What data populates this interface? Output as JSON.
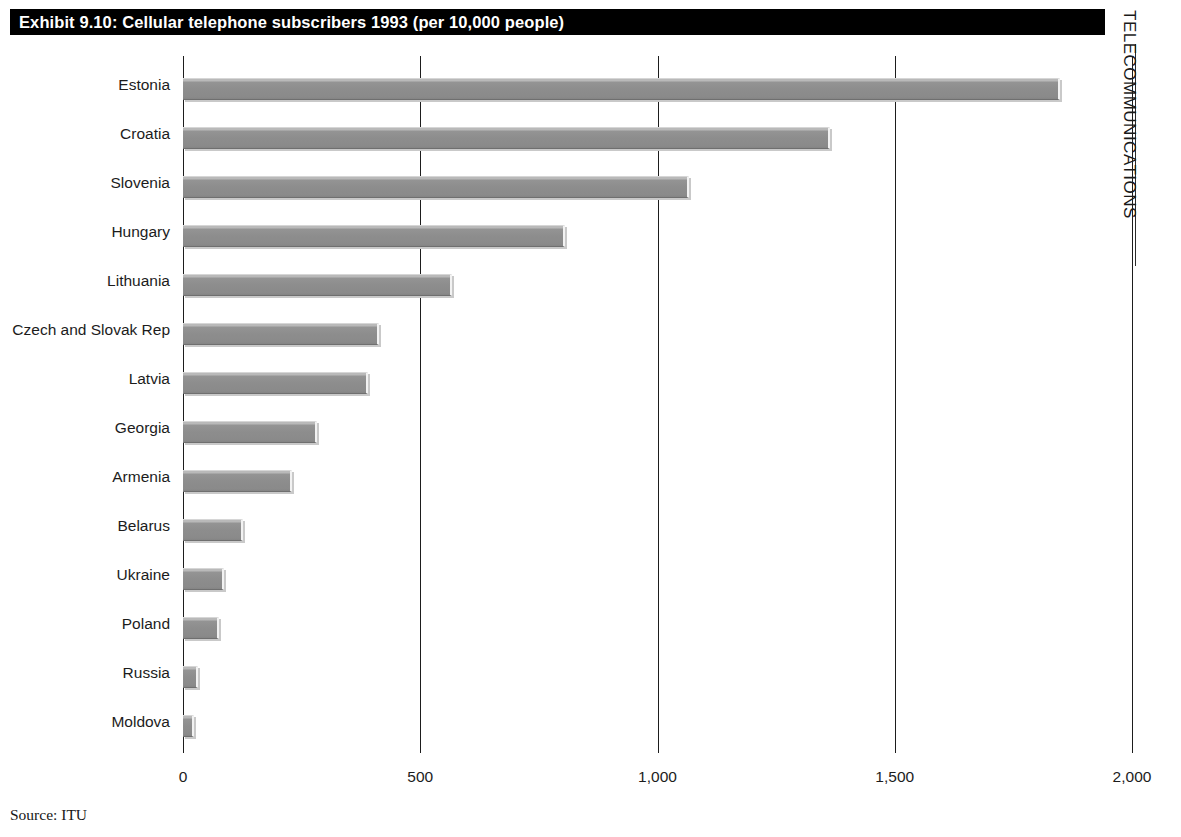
{
  "title": "Exhibit 9.10: Cellular telephone subscribers 1993 (per 10,000 people)",
  "side_caption": "TELECOMMUNICATIONS",
  "source_note": "Source: ITU",
  "colors": {
    "banner_background": "#000000",
    "banner_text": "#ffffff",
    "bar_fill": "#8a8a8a",
    "bar_highlight": "#b9b9b9",
    "bar_shadow": "#c9c9c9",
    "axis": "#1d1d1d",
    "text": "#1c1c1c"
  },
  "chart_data": {
    "type": "bar",
    "orientation": "horizontal",
    "title": "Exhibit 9.10: Cellular telephone subscribers 1993 (per 10,000 people)",
    "xlabel": "",
    "ylabel": "",
    "xlim": [
      0,
      2000
    ],
    "grid": true,
    "legend": "none",
    "xticks": [
      0,
      500,
      1000,
      1500,
      2000
    ],
    "xticklabels": [
      "0",
      "500",
      "1,000",
      "1,500",
      "2,000"
    ],
    "categories": [
      "Estonia",
      "Croatia",
      "Slovenia",
      "Hungary",
      "Lithuania",
      "Czech and Slovak Rep",
      "Latvia",
      "Georgia",
      "Armenia",
      "Belarus",
      "Ukraine",
      "Poland",
      "Russia",
      "Moldova"
    ],
    "values": [
      1848,
      1363,
      1066,
      805,
      567,
      413,
      390,
      282,
      230,
      127,
      87,
      76,
      32,
      23
    ],
    "source": "ITU"
  }
}
